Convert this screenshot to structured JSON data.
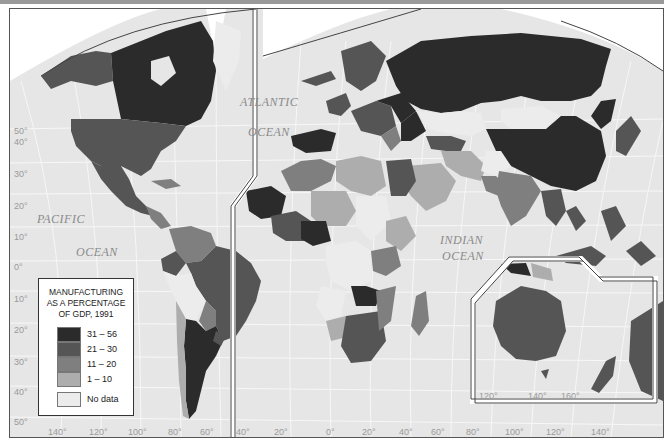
{
  "map": {
    "title": "Manufacturing as a percentage of GDP, 1991",
    "type": "choropleth world map",
    "oceans": [
      {
        "name": "PACIFIC",
        "line2": "OCEAN"
      },
      {
        "name": "ATLANTIC",
        "line2": "OCEAN"
      },
      {
        "name": "INDIAN",
        "line2": "OCEAN"
      }
    ],
    "latitude_labels": [
      "50°",
      "40°",
      "30°",
      "20°",
      "10°",
      "0°",
      "10°",
      "20°",
      "30°",
      "40°",
      "50°"
    ],
    "longitude_labels_west": [
      "140°",
      "120°",
      "100°",
      "80°",
      "60°",
      "40°",
      "20°"
    ],
    "longitude_labels_east": [
      "0°",
      "20°",
      "40°",
      "60°",
      "80°",
      "100°",
      "120°",
      "140°"
    ],
    "inset_longitude_labels": [
      "120°",
      "140°",
      "160°"
    ]
  },
  "legend": {
    "title_line1": "MANUFACTURING",
    "title_line2": "AS A PERCENTAGE",
    "title_line3": "OF GDP, 1991",
    "classes": [
      {
        "label": "31 – 56",
        "color": "#2b2b2b"
      },
      {
        "label": "21 – 30",
        "color": "#555555"
      },
      {
        "label": "11 – 20",
        "color": "#7f7f7f"
      },
      {
        "label": "1 – 10",
        "color": "#adadad"
      }
    ],
    "no_data": {
      "label": "No data",
      "color": "#ececec"
    }
  },
  "colors": {
    "ocean": "#e6e6e6",
    "graticule": "#f6f6f6",
    "frame": "#555555",
    "c1": "#2b2b2b",
    "c2": "#555555",
    "c3": "#7f7f7f",
    "c4": "#adadad",
    "nodata": "#ececec"
  }
}
